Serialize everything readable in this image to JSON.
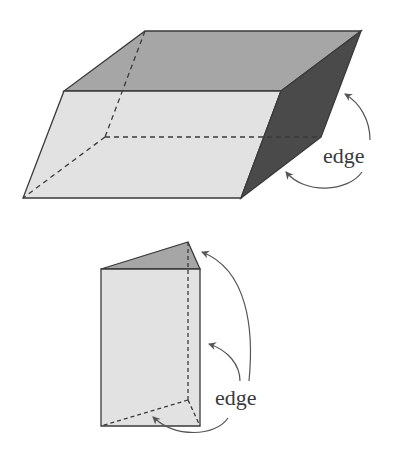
{
  "colors": {
    "front_face": "#e2e2e2",
    "top_face": "#a6a6a6",
    "side_face": "#4a4a4a",
    "edge_line": "#3a3a3a",
    "arrow": "#555555"
  },
  "figures": [
    {
      "name": "parallelepiped",
      "label": "edge",
      "arrow_count": 2
    },
    {
      "name": "triangular-prism",
      "label": "edge",
      "arrow_count": 3
    }
  ]
}
